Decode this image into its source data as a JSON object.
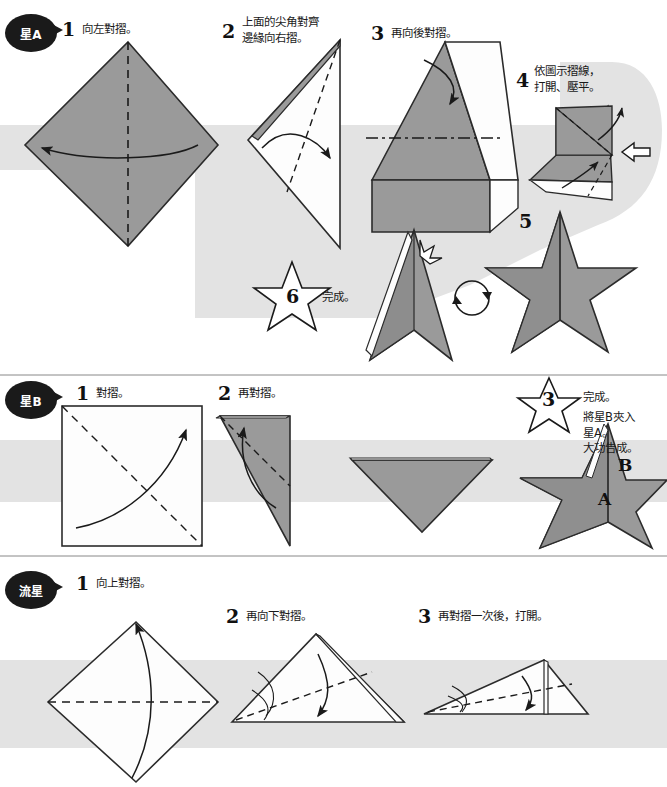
{
  "document": {
    "title": "摺紙星星圖解",
    "colors": {
      "band": "#e3e3e3",
      "paper_gray": "#9a9a9a",
      "paper_white": "#fdfdfd",
      "ink": "#1a1a1a",
      "badge_bg": "#1a1a1a",
      "badge_text": "#ffffff"
    }
  },
  "sections": [
    {
      "id": "star-a",
      "badge": "星A",
      "steps": [
        {
          "num": "1",
          "text": "向左對摺。"
        },
        {
          "num": "2",
          "text": "上面的尖角對齊\n邊緣向右摺。"
        },
        {
          "num": "3",
          "text": "再向後對摺。"
        },
        {
          "num": "4",
          "text": "依圖示摺線，\n打開、壓平。"
        },
        {
          "num": "5",
          "text": ""
        },
        {
          "num": "6",
          "text": "完成。"
        }
      ]
    },
    {
      "id": "star-b",
      "badge": "星B",
      "steps": [
        {
          "num": "1",
          "text": "對摺。"
        },
        {
          "num": "2",
          "text": "再對摺。"
        },
        {
          "num": "3",
          "text": "完成。"
        }
      ],
      "note": "將星B夾入\n星A。\n大功告成。",
      "face_labels": [
        "A",
        "B"
      ]
    },
    {
      "id": "shooting-star",
      "badge": "流星",
      "steps": [
        {
          "num": "1",
          "text": "向上對摺。"
        },
        {
          "num": "2",
          "text": "再向下對摺。"
        },
        {
          "num": "3",
          "text": "再對摺一次後，打開。"
        }
      ]
    }
  ]
}
